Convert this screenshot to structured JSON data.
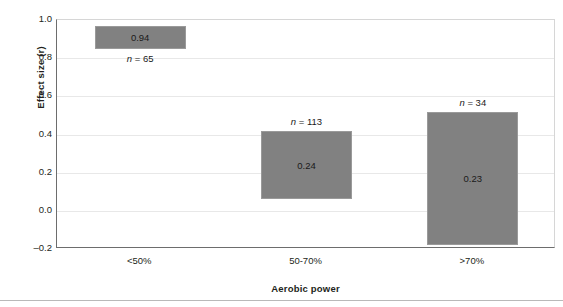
{
  "chart_data": {
    "type": "bar",
    "title": "",
    "subtitle": "",
    "xlabel": "Aerobic power",
    "ylabel": "Effect size (r)",
    "categories": [
      "<50%",
      "50-70%",
      ">70%"
    ],
    "values": [
      0.94,
      0.24,
      0.23
    ],
    "value_labels": [
      "0.94",
      "0.24",
      "0.23"
    ],
    "annotations": [
      "n = 65",
      "n = 113",
      "n = 34"
    ],
    "annotation_prefix": "n",
    "annotation_values": [
      65,
      113,
      34
    ],
    "bar_ranges": [
      {
        "low": 0.85,
        "high": 0.97
      },
      {
        "low": 0.06,
        "high": 0.42
      },
      {
        "low": -0.18,
        "high": 0.52
      }
    ],
    "ylim": [
      -0.2,
      1.0
    ],
    "ytick_labels": [
      "1.0",
      "0.8",
      "0.6",
      "0.4",
      "0.2",
      "0.0",
      "-0.2"
    ],
    "ytick_values": [
      1.0,
      0.8,
      0.6,
      0.4,
      0.2,
      0.0,
      -0.2
    ],
    "grid": true,
    "grid_axis": "y",
    "legend": "none",
    "bar_color": "#818181",
    "bar_edge_color": "#9a9a9a",
    "grid_color": "#e8e8e8",
    "axis_color": "#6d6d6d",
    "text_color": "#231f20"
  }
}
